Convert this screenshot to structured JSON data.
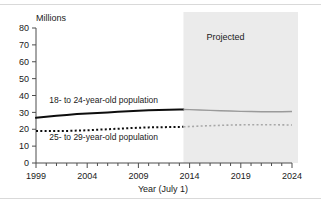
{
  "chart_data": {
    "type": "line",
    "title": "",
    "subtitle": "",
    "xlabel": "Year (July 1)",
    "ylabel": "Millions",
    "ylabel_position": "top-left",
    "xlim": [
      1999,
      2024
    ],
    "ylim": [
      0,
      80
    ],
    "ytick_step": 10,
    "xtick_step": 1,
    "xtick_label_step": 5,
    "grid": false,
    "legend": "inline-annotations",
    "yticks": [
      0,
      10,
      20,
      30,
      40,
      50,
      60,
      70,
      80
    ],
    "ytick_labels": [
      "0",
      "10",
      "20",
      "30",
      "40",
      "50",
      "60",
      "70",
      "80"
    ],
    "xticks": [
      1999,
      2000,
      2001,
      2002,
      2003,
      2004,
      2005,
      2006,
      2007,
      2008,
      2009,
      2010,
      2011,
      2012,
      2013,
      2014,
      2015,
      2016,
      2017,
      2018,
      2019,
      2020,
      2021,
      2022,
      2023,
      2024
    ],
    "xtick_labels_shown": [
      "1999",
      "2004",
      "2009",
      "2014",
      "2019",
      "2024"
    ],
    "projection_start_year": 2013,
    "annotations": [
      {
        "name": "projected-region-label",
        "text": "Projected",
        "x": 2017.5,
        "y": 73
      },
      {
        "name": "series-label-18-24",
        "text": "18- to 24-year-old population",
        "x": 2000.3,
        "y": 35.5
      },
      {
        "name": "series-label-25-29",
        "text": "25- to 29-year-old population",
        "x": 2000.3,
        "y": 13.5
      }
    ],
    "x": [
      1999,
      2000,
      2001,
      2002,
      2003,
      2004,
      2005,
      2006,
      2007,
      2008,
      2009,
      2010,
      2011,
      2012,
      2013,
      2014,
      2015,
      2016,
      2017,
      2018,
      2019,
      2020,
      2021,
      2022,
      2023,
      2024
    ],
    "series": [
      {
        "name": "18- to 24-year-old population",
        "label": "18- to 24-year-old population",
        "style": "solid",
        "color_historical": "#0d0d0d",
        "color_projected": "#9a9a9a",
        "values": [
          26.8,
          27.4,
          28.0,
          28.5,
          29.0,
          29.4,
          29.7,
          30.0,
          30.3,
          30.6,
          30.9,
          31.2,
          31.4,
          31.6,
          31.7,
          31.6,
          31.4,
          31.2,
          31.0,
          30.8,
          30.6,
          30.5,
          30.4,
          30.4,
          30.4,
          30.5
        ]
      },
      {
        "name": "25- to 29-year-old population",
        "label": "25- to 29-year-old population",
        "style": "dotted",
        "color_historical": "#0d0d0d",
        "color_projected": "#a8a8a8",
        "values": [
          19.0,
          18.9,
          18.9,
          19.0,
          19.2,
          19.4,
          19.7,
          20.0,
          20.3,
          20.6,
          20.9,
          21.1,
          21.2,
          21.3,
          21.4,
          21.6,
          21.9,
          22.1,
          22.3,
          22.5,
          22.6,
          22.7,
          22.7,
          22.7,
          22.6,
          22.5
        ]
      }
    ]
  },
  "colors": {
    "projected_band": "#ebebeb",
    "axis": "#4d4d4d",
    "text": "#1a1a1a",
    "rule": "#d9d9d9",
    "background": "#ffffff"
  }
}
